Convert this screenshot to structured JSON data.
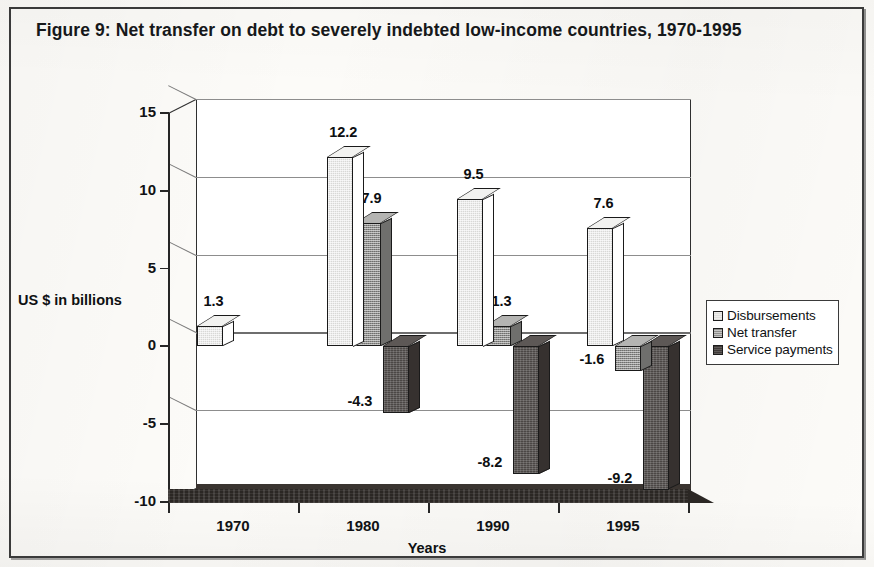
{
  "figure": {
    "title": "Figure 9: Net transfer on debt to severely indebted low-income countries, 1970-1995"
  },
  "chart_data": {
    "type": "bar",
    "title": "Figure 9: Net transfer on debt to severely indebted low-income countries, 1970-1995",
    "xlabel": "Years",
    "ylabel": "US $ in billions",
    "categories": [
      "1970",
      "1980",
      "1990",
      "1995"
    ],
    "ylim": [
      -10,
      15
    ],
    "yticks": [
      "15",
      "10",
      "5",
      "0",
      "-5",
      "-10"
    ],
    "ytick_values": [
      15,
      10,
      5,
      0,
      -5,
      -10
    ],
    "grid": true,
    "legend_position": "right",
    "series": [
      {
        "name": "Disbursements",
        "color": "#d8d8d6",
        "values": [
          1.3,
          12.2,
          9.5,
          7.6
        ],
        "labels": [
          "1.3",
          "12.2",
          "9.5",
          "7.6"
        ]
      },
      {
        "name": "Net transfer",
        "color": "#8e8e8c",
        "values": [
          null,
          7.9,
          1.3,
          -1.6
        ],
        "labels": [
          "",
          "7.9",
          "1.3",
          "-1.6"
        ]
      },
      {
        "name": "Service payments",
        "color": "#4b4745",
        "values": [
          null,
          -4.3,
          -8.2,
          -9.2
        ],
        "labels": [
          "",
          "-4.3",
          "-8.2",
          "-9.2"
        ]
      }
    ]
  },
  "legend": {
    "items": [
      {
        "label": "Disbursements"
      },
      {
        "label": "Net transfer"
      },
      {
        "label": "Service payments"
      }
    ]
  }
}
